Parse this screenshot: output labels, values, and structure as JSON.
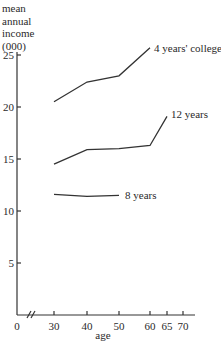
{
  "chart_data": {
    "type": "line",
    "title": "",
    "ylabel": "mean annual income (000)",
    "ylabel_lines": [
      "mean",
      "annual",
      "income",
      "(000)"
    ],
    "xlabel": "age",
    "ylim": [
      0,
      25
    ],
    "yticks": [
      5,
      10,
      15,
      20,
      25
    ],
    "xticks": [
      0,
      30,
      40,
      50,
      60,
      65,
      70
    ],
    "x_axis_break": "between 0 and 30",
    "grid": false,
    "legend": "inline labels at line ends",
    "series": [
      {
        "name": "4 years' college",
        "x": [
          30,
          40,
          50,
          60
        ],
        "values": [
          20.5,
          22.4,
          23.0,
          25.7
        ]
      },
      {
        "name": "12 years",
        "x": [
          30,
          40,
          50,
          60,
          65
        ],
        "values": [
          14.5,
          15.9,
          16.0,
          16.3,
          19.1
        ]
      },
      {
        "name": "8 years",
        "x": [
          30,
          40,
          50
        ],
        "values": [
          11.6,
          11.4,
          11.5
        ]
      }
    ]
  },
  "labels": {
    "y_line1": "mean",
    "y_line2": "annual",
    "y_line3": "income",
    "y_line4": "(000)",
    "x_axis": "age"
  }
}
